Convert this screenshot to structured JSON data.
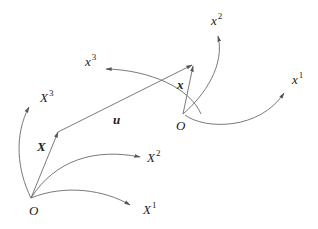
{
  "diagram": {
    "reference_frame": {
      "origin_label": "O",
      "position_vector_label": "X",
      "axes": [
        {
          "label": "X",
          "sup": "1"
        },
        {
          "label": "X",
          "sup": "2"
        },
        {
          "label": "X",
          "sup": "3"
        }
      ]
    },
    "current_frame": {
      "origin_label": "O",
      "position_vector_label": "x",
      "axes": [
        {
          "label": "x",
          "sup": "1"
        },
        {
          "label": "x",
          "sup": "2"
        },
        {
          "label": "x",
          "sup": "3"
        }
      ]
    },
    "displacement_label": "u",
    "colors": {
      "line": "#6a6a6a",
      "text": "#222222",
      "background": "#ffffff"
    }
  }
}
